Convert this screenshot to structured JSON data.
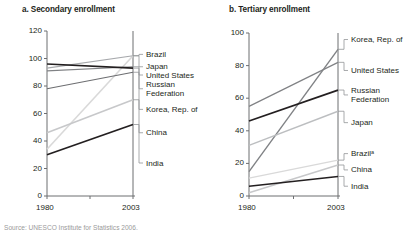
{
  "caption": "Source: UNESCO Institute for Statistics 2006.",
  "charts": [
    {
      "id": "secondary",
      "title": "a. Secondary enrollment",
      "type": "line",
      "xlabel": "",
      "ylabel": "",
      "x": [
        1980,
        2003
      ],
      "xticklabels": [
        "1980",
        "2003"
      ],
      "ylim": [
        0,
        120
      ],
      "yticks": [
        0,
        20,
        40,
        60,
        80,
        100,
        120
      ],
      "yticklabels": [
        "0",
        "20",
        "40",
        "60",
        "80",
        "100",
        "120"
      ],
      "grid": false,
      "legend_position": "right-of-axes",
      "series": [
        {
          "name": "Brazil",
          "values": [
            34,
            102
          ],
          "color": "#d9d9d9",
          "label_y": 103,
          "width": 1.6
        },
        {
          "name": "Japan",
          "values": [
            93,
            102
          ],
          "color": "#a7a9ac",
          "label_y": 94,
          "width": 1.2
        },
        {
          "name": "United States",
          "values": [
            91,
            94
          ],
          "color": "#808285",
          "label_y": 88,
          "width": 1.2
        },
        {
          "name": "Russian Federation",
          "values": [
            96,
            93
          ],
          "color": "#231f20",
          "label_y": 78,
          "width": 1.6
        },
        {
          "name": "Korea, Rep. of",
          "values": [
            78,
            90
          ],
          "color": "#6d6e71",
          "label_y": 63,
          "width": 1.2
        },
        {
          "name": "China",
          "values": [
            46,
            70
          ],
          "color": "#c7c8ca",
          "label_y": 46,
          "width": 1.6
        },
        {
          "name": "India",
          "values": [
            30,
            52
          ],
          "color": "#231f20",
          "label_y": 24,
          "width": 1.8
        }
      ]
    },
    {
      "id": "tertiary",
      "title": "b. Tertiary enrollment",
      "type": "line",
      "xlabel": "",
      "ylabel": "",
      "x": [
        1980,
        2003
      ],
      "xticklabels": [
        "1980",
        "2003"
      ],
      "ylim": [
        0,
        100
      ],
      "yticks": [
        0,
        20,
        40,
        60,
        80,
        100
      ],
      "yticklabels": [
        "0",
        "20",
        "40",
        "60",
        "80",
        "100"
      ],
      "grid": false,
      "legend_position": "right-of-axes",
      "series": [
        {
          "name": "Korea, Rep. of",
          "values": [
            15,
            90
          ],
          "color": "#808285",
          "label_y": 96,
          "width": 1.4
        },
        {
          "name": "United States",
          "values": [
            55,
            82
          ],
          "color": "#808285",
          "label_y": 77,
          "width": 1.2
        },
        {
          "name": "Russian Federation",
          "values": [
            46,
            65
          ],
          "color": "#231f20",
          "label_y": 62,
          "width": 1.8
        },
        {
          "name": "Japan",
          "values": [
            31,
            52
          ],
          "color": "#bcbec0",
          "label_y": 45,
          "width": 1.4
        },
        {
          "name": "Brazilᵃ",
          "values": [
            11,
            22
          ],
          "color": "#d9d9d9",
          "label_y": 26,
          "width": 1.4
        },
        {
          "name": "China",
          "values": [
            2,
            19
          ],
          "color": "#c7c8ca",
          "label_y": 16,
          "width": 1.4
        },
        {
          "name": "India",
          "values": [
            6,
            12
          ],
          "color": "#231f20",
          "label_y": 6,
          "width": 1.6
        }
      ]
    }
  ]
}
